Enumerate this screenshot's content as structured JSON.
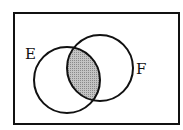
{
  "diagram": {
    "type": "venn",
    "universe": {
      "x": 14,
      "y": 13,
      "width": 165,
      "height": 111
    },
    "sets": [
      {
        "label": "E",
        "cx": 67,
        "cy": 80,
        "r": 33,
        "label_x": 25,
        "label_y": 59
      },
      {
        "label": "F",
        "cx": 100,
        "cy": 68,
        "r": 33,
        "label_x": 136,
        "label_y": 74
      }
    ],
    "shaded_region": "E ∩ F",
    "colors": {
      "stroke": "#111111",
      "shade": "#a8a8a8",
      "background": "#ffffff"
    }
  }
}
